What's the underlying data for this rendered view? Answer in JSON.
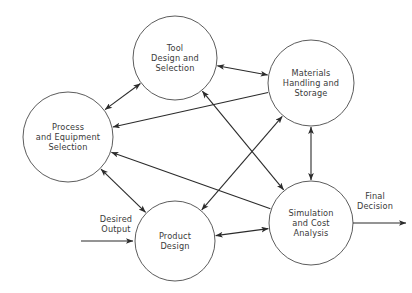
{
  "diagram": {
    "background_color": "#ffffff",
    "node_stroke_color": "#4a4a4a",
    "edge_color": "#2b2b2b",
    "text_color": "#3a3a3a",
    "nodes": [
      {
        "id": "tool-design",
        "name": "Tool Design and Selection",
        "lines": [
          "Tool",
          "Design and",
          "Selection"
        ],
        "cx": 175,
        "cy": 58,
        "r": 42
      },
      {
        "id": "process-equipment",
        "name": "Process and Equipment Selection",
        "lines": [
          "Process",
          "and Equipment",
          "Selection"
        ],
        "cx": 68,
        "cy": 137,
        "r": 45
      },
      {
        "id": "materials-handling",
        "name": "Materials Handling and Storage",
        "lines": [
          "Materials",
          "Handling and",
          "Storage"
        ],
        "cx": 311,
        "cy": 83,
        "r": 43
      },
      {
        "id": "product-design",
        "name": "Product Design",
        "lines": [
          "Product",
          "Design"
        ],
        "cx": 175,
        "cy": 241,
        "r": 40
      },
      {
        "id": "simulation-cost",
        "name": "Simulation and Cost Analysis",
        "lines": [
          "Simulation",
          "and Cost",
          "Analysis"
        ],
        "cx": 311,
        "cy": 223,
        "r": 42
      }
    ],
    "edges": [
      {
        "id": "edge-process-tool",
        "from": "process-equipment",
        "to": "tool-design",
        "arrows": "both"
      },
      {
        "id": "edge-tool-materials",
        "from": "tool-design",
        "to": "materials-handling",
        "arrows": "both"
      },
      {
        "id": "edge-materials-process",
        "from": "materials-handling",
        "to": "process-equipment",
        "arrows": "to-process"
      },
      {
        "id": "edge-simulation-process",
        "from": "simulation-cost",
        "to": "process-equipment",
        "arrows": "to-process"
      },
      {
        "id": "edge-process-product",
        "from": "process-equipment",
        "to": "product-design",
        "arrows": "both"
      },
      {
        "id": "edge-tool-simulation",
        "from": "tool-design",
        "to": "simulation-cost",
        "arrows": "both"
      },
      {
        "id": "edge-product-materials",
        "from": "product-design",
        "to": "materials-handling",
        "arrows": "both"
      },
      {
        "id": "edge-materials-simulation",
        "from": "materials-handling",
        "to": "simulation-cost",
        "arrows": "both"
      },
      {
        "id": "edge-product-simulation",
        "from": "product-design",
        "to": "simulation-cost",
        "arrows": "both"
      }
    ],
    "io_labels": {
      "input": {
        "id": "desired-output",
        "lines": [
          "Desired",
          "Output"
        ],
        "text_x": 116,
        "text_y": 219,
        "arrow_x1": 81,
        "arrow_x2": 133,
        "arrow_y": 241
      },
      "output": {
        "id": "final-decision",
        "lines": [
          "Final",
          "Decision"
        ],
        "text_x": 375,
        "text_y": 196,
        "arrow_x1": 353,
        "arrow_x2": 406,
        "arrow_y": 223
      }
    }
  }
}
